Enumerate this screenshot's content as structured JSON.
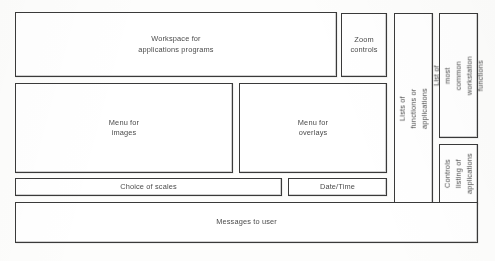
{
  "diagram": {
    "ink_color": "#3a3a3a",
    "page_color": "#fdfdfc",
    "regions": [
      {
        "id": "workspace",
        "label": "Workspace for\napplications programs",
        "orientation": "horizontal"
      },
      {
        "id": "zoom",
        "label": "Zoom\ncontrols",
        "orientation": "horizontal"
      },
      {
        "id": "lists",
        "label": "Lists of functions or applications",
        "orientation": "vertical"
      },
      {
        "id": "common",
        "label": "List of most common\nworkstation functions",
        "orientation": "vertical"
      },
      {
        "id": "ctrl-listing",
        "label": "Controls\nlisting of\napplications",
        "orientation": "vertical"
      },
      {
        "id": "menu-images",
        "label": "Menu for\nimages",
        "orientation": "horizontal"
      },
      {
        "id": "menu-overlays",
        "label": "Menu for\noverlays",
        "orientation": "horizontal"
      },
      {
        "id": "scales",
        "label": "Choice of scales",
        "orientation": "horizontal"
      },
      {
        "id": "datetime",
        "label": "Date/Time",
        "orientation": "horizontal"
      },
      {
        "id": "messages",
        "label": "Messages to user",
        "orientation": "horizontal"
      }
    ]
  }
}
